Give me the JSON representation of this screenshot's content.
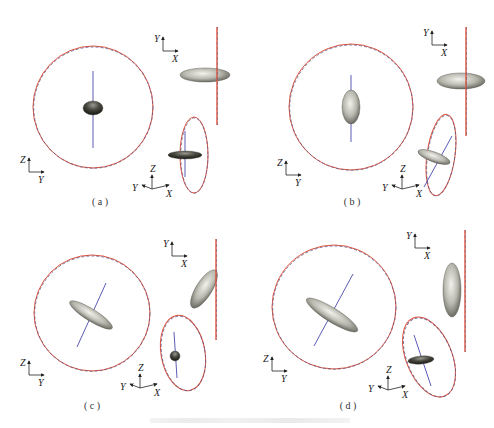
{
  "figure": {
    "caption_text": "",
    "colors": {
      "circle_solid": "#e0503a",
      "circle_dashed": "#5a5a8a",
      "axis_line": "#4a4ab0",
      "ellipsoid_light": "#c8c8c0",
      "ellipsoid_dark": "#3a3a32",
      "triad": "#222222"
    },
    "panels": [
      {
        "label": "( a )",
        "label_pos": [
          100,
          205
        ],
        "big_circle": {
          "cx": 93,
          "cy": 107,
          "rx": 60,
          "ry": 61
        },
        "big_axis": {
          "x1": 93,
          "y1": 71,
          "x2": 93,
          "y2": 148
        },
        "big_ellipsoid": {
          "cx": 93,
          "cy": 108,
          "rx": 10,
          "ry": 7,
          "rot": 0,
          "dark": true
        },
        "zy_triad": {
          "x": 29,
          "y": 172,
          "v": "Z",
          "h": "Y"
        },
        "yx_triad": {
          "x": 163,
          "y": 51,
          "v": "Y",
          "h": "X"
        },
        "side_line": {
          "x1": 217,
          "y1": 27,
          "x2": 217,
          "y2": 125
        },
        "side_ellipsoid": {
          "cx": 205,
          "cy": 75,
          "rx": 25,
          "ry": 7,
          "rot": 0,
          "dark": false
        },
        "small_ellipse": {
          "cx": 194,
          "cy": 155,
          "rx": 14,
          "ry": 38,
          "rot": 0
        },
        "small_axis": {
          "x1": 185,
          "y1": 131,
          "x2": 185,
          "y2": 177
        },
        "small_ellipsoid": {
          "cx": 185,
          "cy": 155,
          "rx": 17,
          "ry": 4,
          "rot": 0,
          "dark": true
        },
        "zyx_triad": {
          "x": 152,
          "y": 189,
          "z": "Z",
          "y_label": "Y",
          "x_label": "X"
        }
      },
      {
        "label": "( b )",
        "label_pos": [
          352,
          205
        ],
        "big_circle": {
          "cx": 351,
          "cy": 107,
          "rx": 62,
          "ry": 63
        },
        "big_axis": {
          "x1": 351,
          "y1": 75,
          "x2": 351,
          "y2": 142
        },
        "big_ellipsoid": {
          "cx": 351,
          "cy": 107,
          "rx": 9,
          "ry": 17,
          "rot": 0,
          "dark": false
        },
        "zy_triad": {
          "x": 286,
          "y": 175,
          "v": "Z",
          "h": "Y"
        },
        "yx_triad": {
          "x": 432,
          "y": 45,
          "v": "Y",
          "h": "X"
        },
        "side_line": {
          "x1": 466,
          "y1": 27,
          "x2": 466,
          "y2": 136
        },
        "side_ellipsoid": {
          "cx": 461,
          "cy": 81,
          "rx": 24,
          "ry": 8,
          "rot": 0,
          "dark": false
        },
        "small_ellipse": {
          "cx": 441,
          "cy": 155,
          "rx": 14,
          "ry": 41,
          "rot": 8
        },
        "small_axis": {
          "x1": 452,
          "y1": 136,
          "x2": 424,
          "y2": 187
        },
        "small_ellipsoid": {
          "cx": 434,
          "cy": 157,
          "rx": 17,
          "ry": 5,
          "rot": 20,
          "dark": false
        },
        "zyx_triad": {
          "x": 402,
          "y": 189,
          "z": "Z",
          "y_label": "Y",
          "x_label": "X"
        }
      },
      {
        "label": "( c )",
        "label_pos": [
          92,
          409
        ],
        "big_circle": {
          "cx": 92,
          "cy": 313,
          "rx": 58,
          "ry": 58
        },
        "big_axis": {
          "x1": 106,
          "y1": 283,
          "x2": 77,
          "y2": 347
        },
        "big_ellipsoid": {
          "cx": 91,
          "cy": 315,
          "rx": 25,
          "ry": 6,
          "rot": 32,
          "dark": false
        },
        "zy_triad": {
          "x": 29,
          "y": 375,
          "v": "Z",
          "h": "Y"
        },
        "yx_triad": {
          "x": 172,
          "y": 256,
          "v": "Y",
          "h": "X"
        },
        "side_line": {
          "x1": 216,
          "y1": 239,
          "x2": 216,
          "y2": 340
        },
        "side_ellipsoid": {
          "cx": 204,
          "cy": 289,
          "rx": 8,
          "ry": 22,
          "rot": 32,
          "dark": false
        },
        "small_ellipse": {
          "cx": 183,
          "cy": 353,
          "rx": 22,
          "ry": 38,
          "rot": -10
        },
        "small_axis": {
          "x1": 174,
          "y1": 332,
          "x2": 177,
          "y2": 378
        },
        "small_ellipsoid": {
          "cx": 175,
          "cy": 356,
          "rx": 5,
          "ry": 5,
          "rot": 0,
          "dark": true
        },
        "zyx_triad": {
          "x": 140,
          "y": 388,
          "z": "Z",
          "y_label": "Y",
          "x_label": "X"
        }
      },
      {
        "label": "( d )",
        "label_pos": [
          348,
          409
        ],
        "big_circle": {
          "cx": 334,
          "cy": 307,
          "rx": 62,
          "ry": 62
        },
        "big_axis": {
          "x1": 353,
          "y1": 274,
          "x2": 314,
          "y2": 346
        },
        "big_ellipsoid": {
          "cx": 332,
          "cy": 315,
          "rx": 30,
          "ry": 7,
          "rot": 32,
          "dark": false
        },
        "zy_triad": {
          "x": 272,
          "y": 371,
          "v": "Z",
          "h": "Y"
        },
        "yx_triad": {
          "x": 415,
          "y": 248,
          "v": "Y",
          "h": "X"
        },
        "side_line": {
          "x1": 465,
          "y1": 230,
          "x2": 465,
          "y2": 352
        },
        "side_ellipsoid": {
          "cx": 452,
          "cy": 290,
          "rx": 9,
          "ry": 27,
          "rot": 0,
          "dark": false
        },
        "small_ellipse": {
          "cx": 429,
          "cy": 357,
          "rx": 23,
          "ry": 42,
          "rot": -22
        },
        "small_axis": {
          "x1": 414,
          "y1": 335,
          "x2": 431,
          "y2": 386
        },
        "small_ellipsoid": {
          "cx": 421,
          "cy": 360,
          "rx": 13,
          "ry": 4,
          "rot": -5,
          "dark": true
        },
        "zyx_triad": {
          "x": 388,
          "y": 390,
          "z": "Z",
          "y_label": "Y",
          "x_label": "X"
        }
      }
    ]
  }
}
